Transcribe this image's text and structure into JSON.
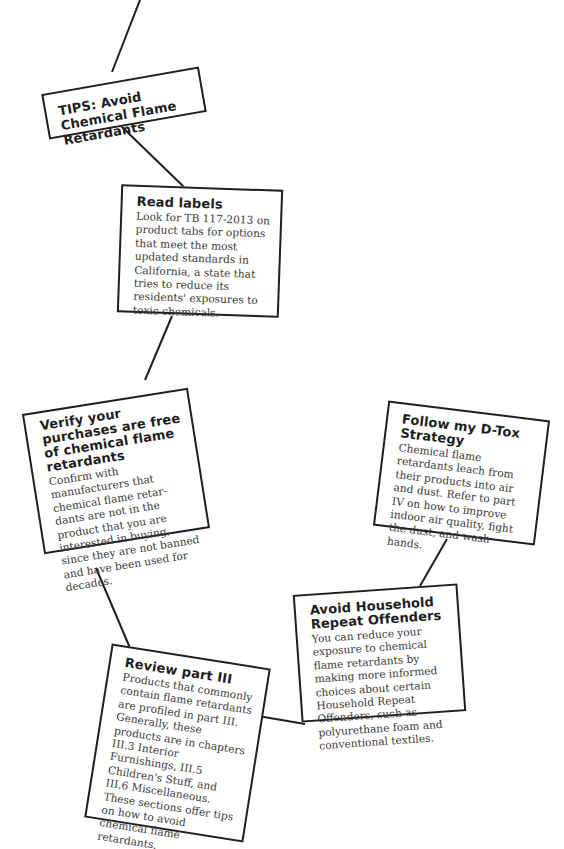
{
  "diagram": {
    "line_color": "#1f1f1f",
    "box_border_color": "#1f1f1f",
    "nodes": [
      {
        "id": "tips",
        "title": "TIPS: Avoid Chemical Flame Retardants",
        "body": ""
      },
      {
        "id": "read-labels",
        "title": "Read labels",
        "body": "Look for TB 117-2013 on product tabs for options that meet the most updated standards in California, a state that tries to reduce its residents' exposures to toxic chemicals."
      },
      {
        "id": "verify",
        "title": "Verify your purchases are free of chemical flame retardants",
        "body": "Confirm with manufacturers that chemical flame retar-dants are not in the product that you are interested in buying, since they are not banned and have been used for decades."
      },
      {
        "id": "dtox",
        "title": "Follow my D-Tox Strategy",
        "body": "Chemical flame retardants leach from their products into air and dust. Refer to part IV on how to improve indoor air quality, fight the dust, and wash hands."
      },
      {
        "id": "household",
        "title": "Avoid Household Repeat Offenders",
        "body": "You can reduce your exposure to chemical flame retardants by making more informed choices about certain Household Repeat Offenders, such as polyurethane foam and conventional textiles."
      },
      {
        "id": "review",
        "title": "Review part III",
        "body": "Products that commonly contain flame retardants are profiled in part III. Generally, these products are in chapters III.3 Interior Furnishings, III.5 Children's Stuff, and III.6 Miscellaneous. These sections offer tips on how to avoid chemical flame retardants."
      }
    ],
    "edges": [
      [
        "top",
        "tips"
      ],
      [
        "tips",
        "read-labels"
      ],
      [
        "read-labels",
        "verify"
      ],
      [
        "verify",
        "review"
      ],
      [
        "review",
        "household"
      ],
      [
        "household",
        "dtox"
      ]
    ]
  }
}
